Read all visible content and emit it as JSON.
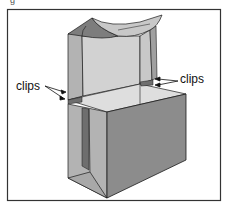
{
  "diagram": {
    "type": "box-assembly-illustration",
    "caption_fragment": "g",
    "labels": {
      "left_callout": "clips",
      "right_callout": "clips"
    },
    "colors": {
      "frame": "#333333",
      "outline": "#1a1a1a",
      "front_face": "#8c8c8c",
      "side_face_dark": "#9a9a9a",
      "side_face_mid": "#b3b3b3",
      "inner_liner": "#d2d2d2",
      "top_surface": "#dedede",
      "curl_dark": "#7d7d7d",
      "curl_light": "#c8c8c8",
      "bottom_face": "#a8a8a8",
      "slot_dark": "#6e6e6e"
    }
  }
}
